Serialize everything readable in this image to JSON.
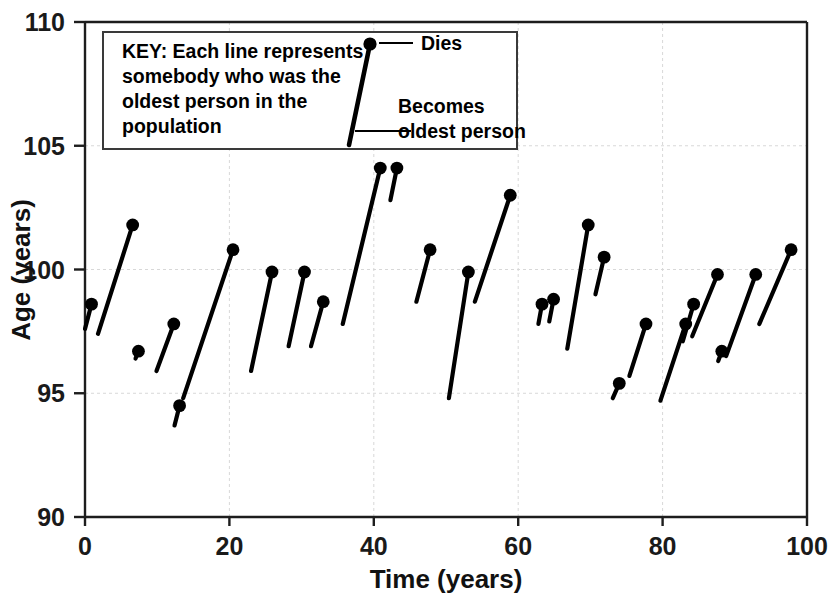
{
  "chart_data": {
    "type": "line",
    "title": "",
    "xlabel": "Time (years)",
    "ylabel": "Age (years)",
    "xlim": [
      0,
      100
    ],
    "ylim": [
      90,
      110
    ],
    "xticks": [
      0,
      20,
      40,
      60,
      80,
      100
    ],
    "yticks": [
      90,
      95,
      100,
      105,
      110
    ],
    "xtick_labels": [
      "0",
      "20",
      "40",
      "60",
      "80",
      "100"
    ],
    "ytick_labels": [
      "90",
      "95",
      "100",
      "105",
      "110"
    ],
    "grid": true,
    "legend_position": "top-left-inside",
    "series_description": "Each segment is one individual's tenure as oldest person: it starts when they become the oldest person and ends with a filled dot when they die.",
    "segments": [
      {
        "id": 1,
        "start_time": 0.0,
        "start_age": 97.6,
        "end_time": 0.9,
        "end_age": 98.6
      },
      {
        "id": 2,
        "start_time": 1.8,
        "start_age": 97.4,
        "end_time": 6.6,
        "end_age": 101.8
      },
      {
        "id": 3,
        "start_time": 7.0,
        "start_age": 96.4,
        "end_time": 7.4,
        "end_age": 96.7
      },
      {
        "id": 4,
        "start_time": 9.9,
        "start_age": 95.9,
        "end_time": 12.3,
        "end_age": 97.8
      },
      {
        "id": 5,
        "start_time": 12.4,
        "start_age": 93.7,
        "end_time": 13.1,
        "end_age": 94.5
      },
      {
        "id": 6,
        "start_time": 13.6,
        "start_age": 94.8,
        "end_time": 20.5,
        "end_age": 100.8
      },
      {
        "id": 7,
        "start_time": 23.0,
        "start_age": 95.9,
        "end_time": 25.9,
        "end_age": 99.9
      },
      {
        "id": 8,
        "start_time": 28.2,
        "start_age": 96.9,
        "end_time": 30.4,
        "end_age": 99.9
      },
      {
        "id": 9,
        "start_time": 31.3,
        "start_age": 96.9,
        "end_time": 33.0,
        "end_age": 98.7
      },
      {
        "id": 10,
        "start_time": 35.7,
        "start_age": 97.8,
        "end_time": 40.9,
        "end_age": 104.1
      },
      {
        "id": 11,
        "start_time": 42.3,
        "start_age": 102.8,
        "end_time": 43.2,
        "end_age": 104.1
      },
      {
        "id": 12,
        "start_time": 45.9,
        "start_age": 98.7,
        "end_time": 47.8,
        "end_age": 100.8
      },
      {
        "id": 13,
        "start_time": 50.4,
        "start_age": 94.8,
        "end_time": 53.1,
        "end_age": 99.9
      },
      {
        "id": 14,
        "start_time": 54.0,
        "start_age": 98.7,
        "end_time": 58.9,
        "end_age": 103.0
      },
      {
        "id": 15,
        "start_time": 62.8,
        "start_age": 97.8,
        "end_time": 63.3,
        "end_age": 98.6
      },
      {
        "id": 16,
        "start_time": 64.3,
        "start_age": 97.9,
        "end_time": 64.9,
        "end_age": 98.8
      },
      {
        "id": 17,
        "start_time": 66.8,
        "start_age": 96.8,
        "end_time": 69.7,
        "end_age": 101.8
      },
      {
        "id": 18,
        "start_time": 70.7,
        "start_age": 99.0,
        "end_time": 71.9,
        "end_age": 100.5
      },
      {
        "id": 19,
        "start_time": 73.1,
        "start_age": 94.8,
        "end_time": 74.0,
        "end_age": 95.4
      },
      {
        "id": 20,
        "start_time": 75.4,
        "start_age": 95.7,
        "end_time": 77.7,
        "end_age": 97.8
      },
      {
        "id": 21,
        "start_time": 79.7,
        "start_age": 94.7,
        "end_time": 83.2,
        "end_age": 97.8
      },
      {
        "id": 22,
        "start_time": 82.8,
        "start_age": 97.1,
        "end_time": 84.3,
        "end_age": 98.6
      },
      {
        "id": 23,
        "start_time": 84.1,
        "start_age": 97.3,
        "end_time": 87.6,
        "end_age": 99.8
      },
      {
        "id": 24,
        "start_time": 87.7,
        "start_age": 96.3,
        "end_time": 88.2,
        "end_age": 96.7
      },
      {
        "id": 25,
        "start_time": 88.8,
        "start_age": 96.5,
        "end_time": 92.9,
        "end_age": 99.8
      },
      {
        "id": 26,
        "start_time": 93.4,
        "start_age": 97.8,
        "end_time": 97.8,
        "end_age": 100.8
      }
    ]
  },
  "key": {
    "label_bold": "KEY:",
    "line1": " Each line represents",
    "line2": "somebody who was the",
    "line3": "oldest person in the",
    "line4": "population",
    "annotation_dies": "Dies",
    "annotation_becomes_line1": "Becomes",
    "annotation_becomes_line2": "oldest person"
  },
  "colors": {
    "ink": "#000000",
    "axis": "#1d1d1d",
    "grid": "#d8d8d8",
    "background": "#ffffff"
  }
}
